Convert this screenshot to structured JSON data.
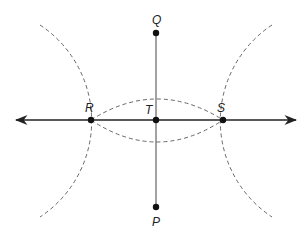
{
  "diagram": {
    "points": [
      {
        "id": "Q",
        "label": "Q",
        "x": 156,
        "y": 33,
        "lx": 152,
        "ly": 24
      },
      {
        "id": "P",
        "label": "P",
        "x": 156,
        "y": 207,
        "lx": 152,
        "ly": 226
      },
      {
        "id": "T",
        "label": "T",
        "x": 156,
        "y": 120,
        "lx": 145,
        "ly": 114
      },
      {
        "id": "R",
        "label": "R",
        "x": 91,
        "y": 120,
        "lx": 85,
        "ly": 112
      },
      {
        "id": "S",
        "label": "S",
        "x": 223,
        "y": 120,
        "lx": 217,
        "ly": 112
      }
    ],
    "line_RS": {
      "x1": 14,
      "x2": 298,
      "y": 120,
      "arrows": "both"
    },
    "segment_PQ": {
      "x": 156,
      "y1": 33,
      "y2": 207
    },
    "colors": {
      "ink": "#222222",
      "dashed": "#666666"
    }
  }
}
